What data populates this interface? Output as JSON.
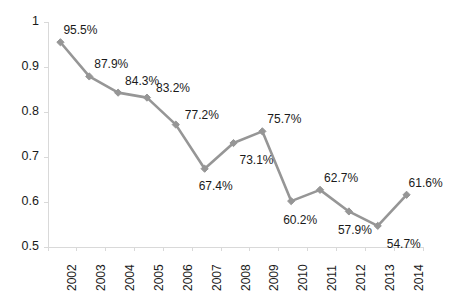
{
  "chart_data": {
    "type": "line",
    "title": "",
    "subtitle": "",
    "xlabel": "",
    "ylabel": "",
    "categories": [
      "2002",
      "2003",
      "2004",
      "2005",
      "2006",
      "2007",
      "2008",
      "2009",
      "2010",
      "2011",
      "2012",
      "2013",
      "2014"
    ],
    "values": [
      0.955,
      0.879,
      0.843,
      0.832,
      0.772,
      0.674,
      0.731,
      0.757,
      0.602,
      0.627,
      0.579,
      0.547,
      0.616
    ],
    "point_labels": [
      "95.5%",
      "87.9%",
      "84.3%",
      "83.2%",
      "77.2%",
      "67.4%",
      "73.1%",
      "75.7%",
      "60.2%",
      "62.7%",
      "57.9%",
      "54.7%",
      "61.6%"
    ],
    "ylim": [
      0.5,
      1.0
    ],
    "ytick_labels": [
      "1",
      "0.9",
      "0.8",
      "0.7",
      "0.6",
      "0.5"
    ],
    "ytick_values": [
      1,
      0.9,
      0.8,
      0.7,
      0.6,
      0.5
    ],
    "grid": false,
    "legend": "none",
    "series_color": "#969696",
    "axis_color": "#d9d9d9",
    "text_color": "#1a1a1a",
    "marker": "diamond"
  }
}
